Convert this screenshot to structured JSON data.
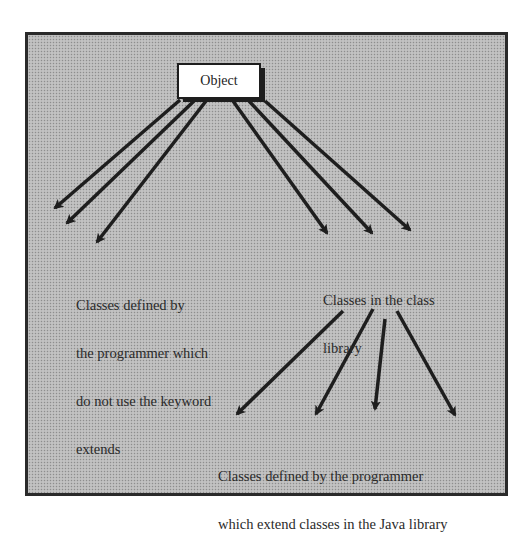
{
  "diagram": {
    "root": {
      "label": "Object"
    },
    "groups": [
      {
        "id": "user-classes",
        "lines": [
          "Classes defined by",
          "the programmer which",
          "do not use the keyword",
          "extends"
        ]
      },
      {
        "id": "library-classes",
        "lines": [
          "Classes in the class",
          "library"
        ]
      },
      {
        "id": "extended-classes",
        "lines": [
          "Classes defined by the programmer",
          "which extend classes in the Java library"
        ]
      }
    ],
    "edges": [
      {
        "from": "Object",
        "to": "user-classes",
        "count": 3
      },
      {
        "from": "Object",
        "to": "library-classes",
        "count": 3
      },
      {
        "from": "library-classes",
        "to": "extended-classes",
        "count": 4
      }
    ],
    "colors": {
      "background": "#b9b9b9",
      "stroke": "#1e1e1e",
      "box": "#ffffff"
    }
  }
}
